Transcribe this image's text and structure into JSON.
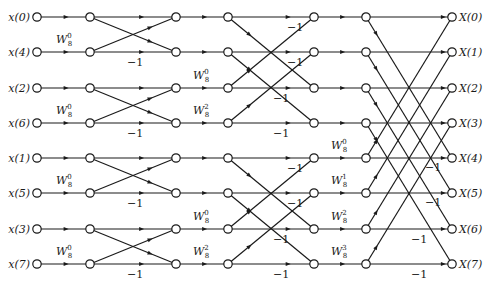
{
  "colors": {
    "stroke": "#1a1a1a",
    "background": "#ffffff"
  },
  "columns_x": [
    37,
    90,
    176,
    228,
    314,
    366,
    452
  ],
  "rows_y": [
    17,
    52,
    88,
    123,
    158,
    193,
    229,
    264
  ],
  "inputs": [
    "x(0)",
    "x(4)",
    "x(2)",
    "x(6)",
    "x(1)",
    "x(5)",
    "x(3)",
    "x(7)"
  ],
  "outputs": [
    "X(0)",
    "X(1)",
    "X(2)",
    "X(3)",
    "X(4)",
    "X(5)",
    "X(6)",
    "X(7)"
  ],
  "twiddles": {
    "stage1": [
      {
        "row": 1,
        "text": "W",
        "sub": "8",
        "sup": "0"
      },
      {
        "row": 3,
        "text": "W",
        "sub": "8",
        "sup": "0"
      },
      {
        "row": 5,
        "text": "W",
        "sub": "8",
        "sup": "0"
      },
      {
        "row": 7,
        "text": "W",
        "sub": "8",
        "sup": "0"
      }
    ],
    "stage2": [
      {
        "row": 2,
        "text": "W",
        "sub": "8",
        "sup": "0"
      },
      {
        "row": 3,
        "text": "W",
        "sub": "8",
        "sup": "2"
      },
      {
        "row": 6,
        "text": "W",
        "sub": "8",
        "sup": "0"
      },
      {
        "row": 7,
        "text": "W",
        "sub": "8",
        "sup": "2"
      }
    ],
    "stage3": [
      {
        "row": 4,
        "text": "W",
        "sub": "8",
        "sup": "0"
      },
      {
        "row": 5,
        "text": "W",
        "sub": "8",
        "sup": "1"
      },
      {
        "row": 6,
        "text": "W",
        "sub": "8",
        "sup": "2"
      },
      {
        "row": 7,
        "text": "W",
        "sub": "8",
        "sup": "3"
      }
    ]
  },
  "neg_label": "−1",
  "stages": [
    {
      "name": "stage1",
      "pairs": [
        [
          0,
          1
        ],
        [
          2,
          3
        ],
        [
          4,
          5
        ],
        [
          6,
          7
        ]
      ]
    },
    {
      "name": "stage2",
      "pairs": [
        [
          0,
          2
        ],
        [
          1,
          3
        ],
        [
          4,
          6
        ],
        [
          5,
          7
        ]
      ]
    },
    {
      "name": "stage3",
      "pairs": [
        [
          0,
          4
        ],
        [
          1,
          5
        ],
        [
          2,
          6
        ],
        [
          3,
          7
        ]
      ]
    }
  ]
}
